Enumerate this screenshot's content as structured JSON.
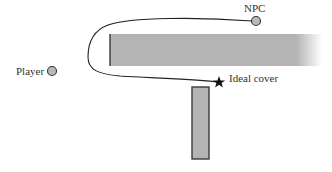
{
  "diagram": {
    "labels": {
      "npc": "NPC",
      "player": "Player",
      "cover": "Ideal cover"
    },
    "entities": {
      "npc": {
        "type": "circle",
        "cx": 256,
        "cy": 21,
        "r": 4.5
      },
      "player": {
        "type": "circle",
        "cx": 52,
        "cy": 71,
        "r": 4.5
      },
      "cover": {
        "type": "star",
        "cx": 219,
        "cy": 82
      }
    },
    "obstacles": [
      {
        "name": "horizontal-wall",
        "x": 110,
        "y": 34,
        "width": 212,
        "height": 32,
        "fades_right": true
      },
      {
        "name": "vertical-wall",
        "x": 192,
        "y": 87,
        "width": 17,
        "height": 72
      }
    ],
    "path": {
      "from": "npc",
      "to": "cover",
      "description": "route around left end of horizontal wall"
    },
    "colors": {
      "obstacle_fill": "#b4b4b4",
      "obstacle_stroke": "#3a3a3a",
      "circle_fill": "#b8b8b8",
      "path": "#222222",
      "text": "#333333"
    }
  }
}
